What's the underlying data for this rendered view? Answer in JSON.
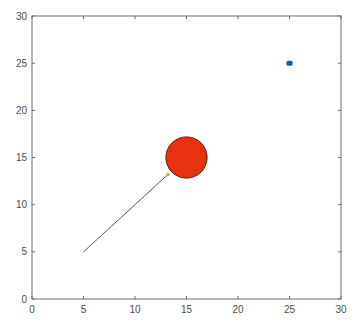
{
  "chart_data": {
    "type": "scatter",
    "title": "",
    "xlabel": "",
    "ylabel": "",
    "xlim": [
      0,
      30
    ],
    "ylim": [
      0,
      30
    ],
    "grid": false,
    "legend": null,
    "xticks": [
      "0",
      "5",
      "10",
      "15",
      "20",
      "25",
      "30"
    ],
    "yticks": [
      "0",
      "5",
      "10",
      "15",
      "20",
      "25",
      "30"
    ],
    "series": [
      {
        "name": "target-point",
        "kind": "marker",
        "x": 25,
        "y": 25,
        "color": "#1f5a96",
        "size": "small-square"
      },
      {
        "name": "obstacle-circle",
        "kind": "circle",
        "x": 15,
        "y": 15,
        "radius": 2,
        "color": "#e8320f",
        "edge_color": "#5a1a0a"
      },
      {
        "name": "path-line",
        "kind": "line",
        "x": [
          5,
          13.2
        ],
        "y": [
          5,
          13.2
        ],
        "color": "#555555"
      },
      {
        "name": "agent-point",
        "kind": "marker",
        "x": 13.2,
        "y": 13.2,
        "color": "#f0a030",
        "size": "tiny"
      }
    ]
  },
  "axes": {
    "x_tick_labels": [
      "0",
      "5",
      "10",
      "15",
      "20",
      "25",
      "30"
    ],
    "y_tick_labels": [
      "0",
      "5",
      "10",
      "15",
      "20",
      "25",
      "30"
    ]
  }
}
